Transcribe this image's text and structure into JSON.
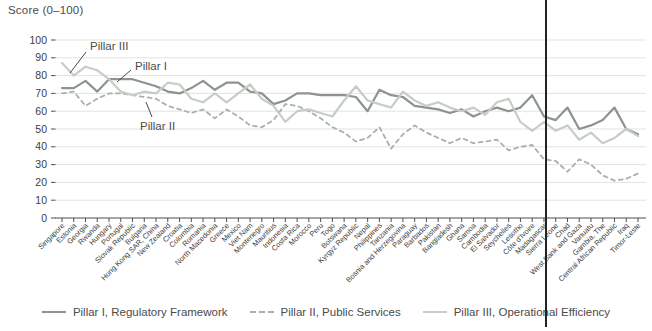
{
  "title": "Score (0–100)",
  "colors": {
    "pillar1": "#8b948d",
    "pillar2": "#a7b2a8",
    "pillar3": "#c5cec5",
    "grid": "#e3e3e0",
    "axis": "#4f4f4f",
    "tick_text": "#3d3d3d",
    "label_text": "#4b4b4b",
    "rule": "#232323"
  },
  "legend": {
    "items": [
      {
        "label": "Pillar I, Regulatory Framework",
        "style": "solid",
        "color": "#8b948d"
      },
      {
        "label": "Pillar II, Public Services",
        "style": "dashed",
        "color": "#a7b2a8"
      },
      {
        "label": "Pillar III, Operational Efficiency",
        "style": "solid",
        "color": "#c5cec5"
      }
    ]
  },
  "annotations": [
    {
      "text": "Pillar III",
      "tx": 90,
      "ty": 50,
      "line": [
        [
          86,
          52
        ],
        [
          70,
          73
        ]
      ]
    },
    {
      "text": "Pillar I",
      "tx": 135,
      "ty": 70,
      "line": [
        [
          131,
          70
        ],
        [
          117,
          82
        ]
      ]
    },
    {
      "text": "Pillar II",
      "tx": 140,
      "ty": 130,
      "line": [
        [
          152,
          117
        ],
        [
          146,
          102
        ]
      ]
    }
  ],
  "chart_data": {
    "type": "line",
    "title": "Score (0–100)",
    "ylabel": "Score (0–100)",
    "xlabel": "",
    "ylim": [
      0,
      100
    ],
    "ytick_step": 10,
    "grid": "horizontal",
    "legend_position": "bottom",
    "categories": [
      "Singapore",
      "Estonia",
      "Georgia",
      "Rwanda",
      "Hungary",
      "Portugal",
      "Slovak Republic",
      "Bulgaria",
      "Hong Kong SAR, China",
      "New Zealand",
      "Croatia",
      "Colombia",
      "Romania",
      "North Macedonia",
      "Greece",
      "Mexico",
      "Viet Nam",
      "Montenegro",
      "Mauritius",
      "Indonesia",
      "Costa Rica",
      "Morocco",
      "Peru",
      "Togo",
      "Botswana",
      "Kyrgyz Republic",
      "Nepal",
      "Philippines",
      "Tanzania",
      "Bosnia and Herzegovina",
      "Paraguay",
      "Barbados",
      "Pakistan",
      "Bangladesh",
      "Ghana",
      "Samoa",
      "Cambodia",
      "El Salvador",
      "Seychelles",
      "Lesotho",
      "Côte d'Ivoire",
      "Madagascar",
      "Sierra Leone",
      "Chad",
      "West Bank and Gaza",
      "Vanuatu",
      "Gambia, The",
      "Central African Republic",
      "Iraq",
      "Timor-Leste"
    ],
    "series": [
      {
        "name": "Pillar I, Regulatory Framework",
        "color": "#8b948d",
        "dash": "",
        "width": 2.2,
        "values": [
          73,
          73,
          77,
          71,
          78,
          78,
          78,
          76,
          74,
          71,
          70,
          73,
          77,
          72,
          76,
          76,
          71,
          70,
          64,
          66,
          70,
          70,
          69,
          69,
          69,
          68,
          60,
          72,
          69,
          68,
          63,
          62,
          61,
          59,
          61,
          57,
          60,
          62,
          60,
          62,
          69,
          57,
          55,
          62,
          50,
          52,
          55,
          62,
          50,
          47
        ]
      },
      {
        "name": "Pillar II, Public Services",
        "color": "#a7b2a8",
        "dash": "4,4",
        "width": 1.8,
        "values": [
          70,
          71,
          63,
          67,
          70,
          70,
          69,
          68,
          67,
          63,
          61,
          59,
          61,
          56,
          61,
          57,
          52,
          51,
          55,
          64,
          63,
          60,
          56,
          51,
          48,
          43,
          45,
          51,
          39,
          47,
          52,
          48,
          45,
          42,
          45,
          42,
          43,
          44,
          38,
          40,
          41,
          33,
          32,
          26,
          33,
          30,
          24,
          21,
          22,
          25
        ]
      },
      {
        "name": "Pillar III, Operational Efficiency",
        "color": "#c5cec5",
        "dash": "",
        "width": 2.2,
        "values": [
          87,
          80,
          85,
          83,
          78,
          71,
          69,
          71,
          70,
          76,
          75,
          67,
          65,
          70,
          65,
          70,
          75,
          67,
          63,
          54,
          60,
          61,
          59,
          57,
          66,
          74,
          66,
          64,
          62,
          71,
          66,
          63,
          65,
          62,
          60,
          62,
          58,
          65,
          67,
          54,
          49,
          54,
          49,
          52,
          44,
          48,
          42,
          45,
          50,
          46
        ]
      }
    ]
  },
  "vertical_rule_x": 545
}
